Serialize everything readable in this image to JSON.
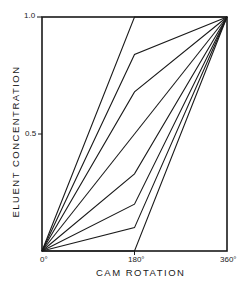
{
  "chart_data": {
    "type": "line",
    "title": "",
    "xlabel": "CAM ROTATION",
    "ylabel": "ELUENT CONCENTRATION",
    "x": [
      0,
      180,
      360
    ],
    "x_tick_labels": [
      "0°",
      "180°",
      "360°"
    ],
    "y_tick_labels": [
      "0.5",
      "1.0"
    ],
    "y_ticks": [
      0.5,
      1.0
    ],
    "xlim": [
      0,
      360
    ],
    "ylim": [
      0,
      1.0
    ],
    "grid": false,
    "legend": null,
    "series": [
      {
        "name": "curve-1",
        "values": [
          0,
          1.0,
          1.0
        ]
      },
      {
        "name": "curve-2",
        "values": [
          0,
          0.84,
          1.0
        ]
      },
      {
        "name": "curve-3",
        "values": [
          0,
          0.68,
          1.0
        ]
      },
      {
        "name": "curve-4",
        "values": [
          0,
          0.5,
          1.0
        ]
      },
      {
        "name": "curve-5",
        "values": [
          0,
          0.33,
          1.0
        ]
      },
      {
        "name": "curve-6",
        "values": [
          0,
          0.2,
          1.0
        ]
      },
      {
        "name": "curve-7",
        "values": [
          0,
          0.1,
          1.0
        ]
      },
      {
        "name": "curve-8",
        "values": [
          0,
          0.0,
          1.0
        ]
      }
    ],
    "line_color": "#1a1a1a"
  }
}
